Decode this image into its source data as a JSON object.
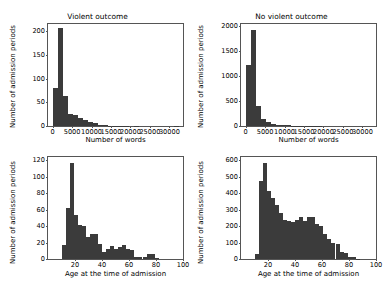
{
  "figure": {
    "width": 389,
    "height": 292,
    "background": "#ffffff",
    "bar_color": "#3b3b3b",
    "axis_color": "#555555",
    "text_color": "#000000"
  },
  "chart_data": [
    {
      "id": "violent-words",
      "type": "bar",
      "title": "Violent outcome",
      "xlabel": "Number of words",
      "ylabel": "Number of admission periods",
      "xlim": [
        -1200,
        33500
      ],
      "ylim": [
        0,
        215
      ],
      "xticks": [
        0,
        5000,
        10000,
        15000,
        20000,
        25000,
        30000
      ],
      "xtick_labels": [
        "0",
        "5000",
        "10000",
        "15000",
        "20000",
        "25000",
        "30000"
      ],
      "yticks": [
        0,
        50,
        100,
        150,
        200
      ],
      "ytick_labels": [
        "0",
        "50",
        "100",
        "150",
        "200"
      ],
      "grid": false,
      "legend": "none",
      "bin_edges": [
        0,
        1300,
        2600,
        3900,
        5200,
        6500,
        7800,
        9100,
        10400,
        11700,
        13000,
        14300,
        15600,
        16900,
        18200,
        19500,
        20800,
        22100,
        23400,
        24700,
        26000,
        27300,
        28600,
        29900,
        31200,
        32500
      ],
      "values": [
        80,
        207,
        64,
        25,
        23,
        17,
        12,
        9,
        6,
        3,
        2,
        1,
        1,
        1,
        1,
        0,
        1,
        0,
        0,
        0,
        0,
        0,
        0,
        0,
        1
      ]
    },
    {
      "id": "nonviolent-words",
      "type": "bar",
      "title": "No violent outcome",
      "xlabel": "Number of words",
      "ylabel": "Number of admission periods",
      "xlim": [
        -1200,
        33500
      ],
      "ylim": [
        0,
        2050
      ],
      "xticks": [
        0,
        5000,
        10000,
        15000,
        20000,
        25000,
        30000
      ],
      "xtick_labels": [
        "0",
        "5000",
        "10000",
        "15000",
        "20000",
        "25000",
        "30000"
      ],
      "yticks": [
        0,
        500,
        1000,
        1500,
        2000
      ],
      "ytick_labels": [
        "0",
        "500",
        "1000",
        "1500",
        "2000"
      ],
      "grid": false,
      "legend": "none",
      "bin_edges": [
        0,
        1300,
        2600,
        3900,
        5200,
        6500,
        7800,
        9100,
        10400,
        11700,
        13000,
        14300,
        15600,
        16900,
        18200,
        19500,
        20800,
        22100,
        23400,
        24700,
        26000,
        27300,
        28600,
        29900,
        31200,
        32500
      ],
      "values": [
        1220,
        1930,
        400,
        140,
        75,
        45,
        30,
        20,
        12,
        8,
        5,
        4,
        3,
        2,
        2,
        1,
        1,
        1,
        0,
        0,
        0,
        0,
        0,
        0,
        1
      ]
    },
    {
      "id": "violent-age",
      "type": "bar",
      "title": "",
      "xlabel": "Age at the time of admission",
      "ylabel": "Number of admission periods",
      "xlim": [
        0,
        100
      ],
      "ylim": [
        0,
        124
      ],
      "xticks": [
        20,
        40,
        60,
        80,
        100
      ],
      "xtick_labels": [
        "20",
        "40",
        "60",
        "80",
        "100"
      ],
      "yticks": [
        0,
        20,
        40,
        60,
        80,
        100,
        120
      ],
      "ytick_labels": [
        "0",
        "20",
        "40",
        "60",
        "80",
        "100",
        "120"
      ],
      "grid": false,
      "legend": "none",
      "bin_edges": [
        10,
        13,
        16,
        19,
        22,
        25,
        28,
        31,
        34,
        37,
        40,
        43,
        46,
        49,
        52,
        55,
        58,
        61,
        64,
        67,
        70,
        73,
        76,
        79,
        82
      ],
      "values": [
        17,
        62,
        117,
        54,
        41,
        40,
        27,
        31,
        30,
        18,
        8,
        12,
        16,
        12,
        14,
        17,
        12,
        11,
        3,
        2,
        2,
        6,
        6,
        1
      ]
    },
    {
      "id": "nonviolent-age",
      "type": "bar",
      "title": "",
      "xlabel": "Age at the time of admission",
      "ylabel": "Number of admission periods",
      "xlim": [
        0,
        100
      ],
      "ylim": [
        0,
        620
      ],
      "xticks": [
        20,
        40,
        60,
        80,
        100
      ],
      "xtick_labels": [
        "20",
        "40",
        "60",
        "80",
        "100"
      ],
      "yticks": [
        0,
        100,
        200,
        300,
        400,
        500,
        600
      ],
      "ytick_labels": [
        "0",
        "100",
        "200",
        "300",
        "400",
        "500",
        "600"
      ],
      "grid": false,
      "legend": "none",
      "bin_edges": [
        10,
        13,
        16,
        19,
        22,
        25,
        28,
        31,
        34,
        37,
        40,
        43,
        46,
        49,
        52,
        55,
        58,
        61,
        64,
        67,
        70,
        73,
        76,
        79,
        82,
        85,
        88
      ],
      "values": [
        30,
        475,
        585,
        415,
        370,
        330,
        280,
        240,
        230,
        225,
        240,
        255,
        230,
        255,
        255,
        215,
        200,
        150,
        120,
        95,
        90,
        45,
        35,
        10,
        15,
        2
      ]
    }
  ]
}
